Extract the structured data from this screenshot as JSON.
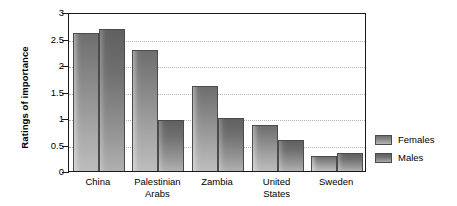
{
  "chart_data": {
    "type": "bar",
    "title": "",
    "xlabel": "",
    "ylabel": "Ratings of importance",
    "ylim": [
      0,
      3
    ],
    "yticks": [
      "0",
      "0.5",
      "1",
      "1.5",
      "2",
      "2.5",
      "3"
    ],
    "ytick_values": [
      0,
      0.5,
      1,
      1.5,
      2,
      2.5,
      3
    ],
    "grid": true,
    "grid_axis": "y",
    "grid_style": "dotted",
    "legend_position": "right",
    "categories": [
      "China",
      "Palestinian Arabs",
      "Zambia",
      "United States",
      "Sweden"
    ],
    "category_lines": [
      [
        "China"
      ],
      [
        "Palestinian",
        "Arabs"
      ],
      [
        "Zambia"
      ],
      [
        "United",
        "States"
      ],
      [
        "Sweden"
      ]
    ],
    "series": [
      {
        "name": "Females",
        "color": "#8a8a8a",
        "values": [
          2.6,
          2.28,
          1.6,
          0.87,
          0.28
        ]
      },
      {
        "name": "Males",
        "color": "#6f6f6f",
        "values": [
          2.68,
          0.96,
          1.0,
          0.58,
          0.34
        ]
      }
    ]
  },
  "legend": {
    "entries": [
      {
        "label": "Females",
        "swatch": "female-swatch"
      },
      {
        "label": "Males",
        "swatch": "male-swatch"
      }
    ]
  },
  "colors": {
    "axis": "#1a1a1a",
    "gridline": "#b4b4b4",
    "bar_outline": "#4b4b4b",
    "background": "#ffffff"
  }
}
